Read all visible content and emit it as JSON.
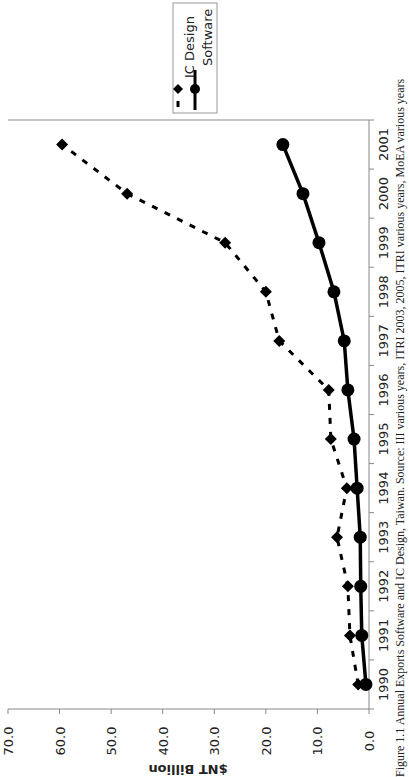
{
  "chart_data": {
    "type": "line",
    "orientation": "rotated-90-clockwise-on-page",
    "title": "",
    "caption": "Figure 1.1  Annual Exports Software and IC Design, Taiwan. Source: III various years, ITRI 2003, 2005, ITRI various years, MoEA various years",
    "xlabel": "",
    "ylabel": "$NT Billion",
    "categories": [
      "1990",
      "1991",
      "1992",
      "1993",
      "1994",
      "1995",
      "1996",
      "1997",
      "1998",
      "1999",
      "2000",
      "2001"
    ],
    "series": [
      {
        "name": "IC Design",
        "marker": "diamond",
        "line_style": "dashed",
        "values": [
          2.1,
          3.7,
          4.1,
          6.2,
          4.3,
          7.4,
          7.8,
          17.4,
          20.0,
          27.9,
          46.9,
          59.5
        ]
      },
      {
        "name": "Software",
        "marker": "circle",
        "line_style": "solid",
        "values": [
          0.6,
          1.4,
          1.6,
          1.7,
          2.3,
          2.9,
          4.1,
          4.8,
          6.8,
          9.7,
          12.8,
          16.7
        ]
      }
    ],
    "ylim": [
      0,
      70
    ],
    "yticks": [
      "0.0",
      "10.0",
      "20.0",
      "30.0",
      "40.0",
      "50.0",
      "60.0",
      "70.0"
    ],
    "grid": false,
    "legend": {
      "position": "top-right",
      "entries": [
        "IC Design",
        "Software"
      ]
    }
  },
  "colors": {
    "series": "#000000",
    "axis": "#888888",
    "text": "#222222"
  }
}
